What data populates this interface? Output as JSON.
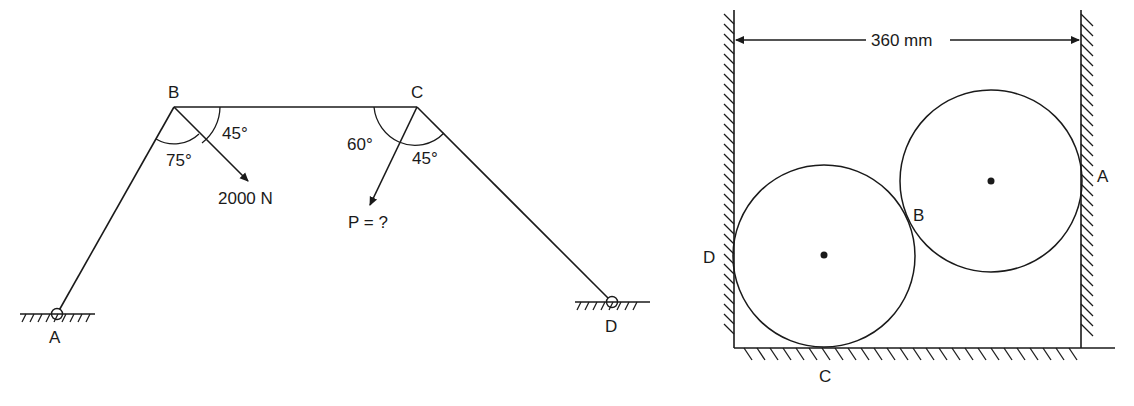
{
  "figure_left": {
    "title": "Cable/link system ABCD",
    "points": {
      "A": "A",
      "B": "B",
      "C": "C",
      "D": "D"
    },
    "angles": {
      "B_upper": "45°",
      "B_lower": "75°",
      "C_left": "60°",
      "C_right": "45°"
    },
    "loads": {
      "B_load": "2000 N",
      "C_load": "P = ?"
    }
  },
  "figure_right": {
    "title": "Two cylinders in a channel",
    "dimension": "360 mm",
    "points": {
      "A": "A",
      "B": "B",
      "C": "C",
      "D": "D"
    }
  },
  "colors": {
    "ink": "#1a1a1a",
    "background": "#ffffff"
  }
}
